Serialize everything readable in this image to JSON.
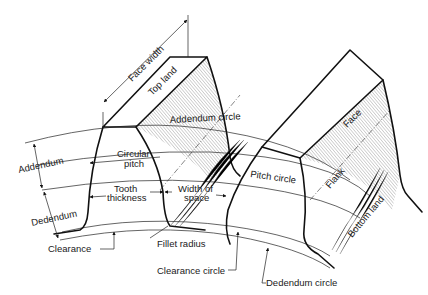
{
  "diagram": {
    "stroke_color": "#111111",
    "background": "#ffffff",
    "labels": {
      "face_width": "Face width",
      "top_land": "Top land",
      "addendum_circle": "Addendum circle",
      "face": "Face",
      "addendum": "Addendum",
      "circular_pitch_line1": "Circular",
      "circular_pitch_line2": "pitch",
      "pitch_circle": "Pitch circle",
      "flank": "Flank",
      "tooth_thickness_line1": "Tooth",
      "tooth_thickness_line2": "thickness",
      "width_of_space_line1": "Width of",
      "width_of_space_line2": "space",
      "dedendum": "Dedendum",
      "bottom_land": "Bottom land",
      "clearance": "Clearance",
      "fillet_radius": "Fillet radius",
      "clearance_circle": "Clearance circle",
      "dedendum_circle": "Dedendum circle"
    }
  }
}
